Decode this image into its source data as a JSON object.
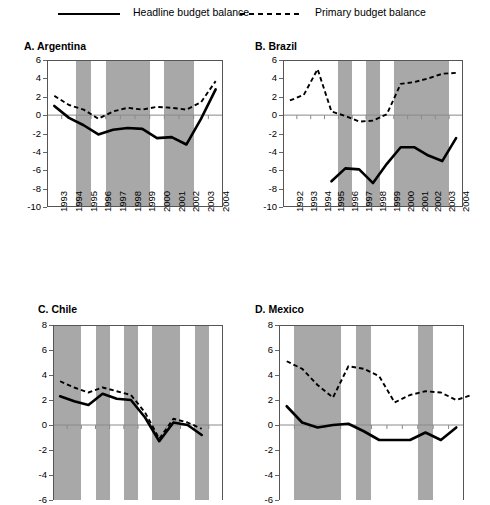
{
  "legend": {
    "items": [
      {
        "label": "Headline budget balance",
        "style": "solid"
      },
      {
        "label": "Primary budget balance",
        "style": "dashed"
      }
    ]
  },
  "chart_data": [
    {
      "type": "line",
      "title": "A. Argentina",
      "xlabel": "",
      "ylabel": "",
      "ylim": [
        -10,
        6
      ],
      "yticks": [
        6,
        4,
        2,
        0,
        -2,
        -4,
        -6,
        -8,
        -10
      ],
      "grid": false,
      "legend_position": "top",
      "categories": [
        "1993",
        "1994",
        "1995",
        "1996",
        "1997",
        "1998",
        "1999",
        "2000",
        "2001",
        "2002",
        "2003",
        "2004"
      ],
      "shaded_bands": [
        [
          "1995",
          "1995"
        ],
        [
          "1997",
          "1999"
        ],
        [
          "2001",
          "2002"
        ]
      ],
      "series": [
        {
          "name": "Headline budget balance",
          "style": "solid",
          "values": [
            1.0,
            -0.3,
            -1.1,
            -2.1,
            -1.6,
            -1.4,
            -1.5,
            -2.5,
            -2.4,
            -3.2,
            -0.4,
            2.8
          ]
        },
        {
          "name": "Primary budget balance",
          "style": "dashed",
          "values": [
            2.1,
            1.1,
            0.6,
            -0.4,
            0.4,
            0.8,
            0.6,
            0.9,
            0.8,
            0.6,
            1.4,
            3.7
          ]
        }
      ]
    },
    {
      "type": "line",
      "title": "B. Brazil",
      "xlabel": "",
      "ylabel": "",
      "ylim": [
        -10,
        6
      ],
      "yticks": [
        6,
        4,
        2,
        0,
        -2,
        -4,
        -6,
        -8,
        -10
      ],
      "grid": false,
      "legend_position": "top",
      "categories": [
        "1992",
        "1993",
        "1994",
        "1995",
        "1996",
        "1997",
        "1998",
        "1999",
        "2000",
        "2001",
        "2002",
        "2003",
        "2004"
      ],
      "shaded_bands": [
        [
          "1996",
          "1996"
        ],
        [
          "1998",
          "1998"
        ],
        [
          "2000",
          "2003"
        ]
      ],
      "series": [
        {
          "name": "Headline budget balance",
          "style": "solid",
          "values": [
            null,
            null,
            null,
            -7.2,
            -5.8,
            -5.9,
            -7.4,
            -5.3,
            -3.5,
            -3.5,
            -4.4,
            -5.0,
            -2.5
          ]
        },
        {
          "name": "Primary budget balance",
          "style": "dashed",
          "values": [
            1.6,
            2.2,
            5.0,
            0.4,
            -0.1,
            -0.7,
            -0.6,
            0.1,
            3.4,
            3.6,
            4.0,
            4.5,
            4.6
          ]
        }
      ]
    },
    {
      "type": "line",
      "title": "C. Chile",
      "xlabel": "",
      "ylabel": "",
      "ylim": [
        -6,
        8
      ],
      "yticks": [
        8,
        6,
        4,
        2,
        0,
        -2,
        -4,
        -6
      ],
      "grid": false,
      "legend_position": "top",
      "categories": [
        "1",
        "2",
        "3",
        "4",
        "5",
        "6",
        "7",
        "8",
        "9",
        "10",
        "11",
        "12"
      ],
      "shaded_bands": [
        [
          "1",
          "2"
        ],
        [
          "4",
          "4"
        ],
        [
          "6",
          "6"
        ],
        [
          "8",
          "9"
        ],
        [
          "11",
          "11"
        ]
      ],
      "series": [
        {
          "name": "Headline budget balance",
          "style": "solid",
          "values": [
            2.3,
            1.9,
            1.6,
            2.5,
            2.1,
            2.0,
            0.6,
            -1.3,
            0.2,
            0.0,
            -0.8,
            null
          ]
        },
        {
          "name": "Primary budget balance",
          "style": "dashed",
          "values": [
            3.5,
            3.0,
            2.6,
            3.0,
            2.7,
            2.4,
            1.0,
            -1.1,
            0.5,
            0.2,
            -0.3,
            null
          ]
        }
      ]
    },
    {
      "type": "line",
      "title": "D. Mexico",
      "xlabel": "",
      "ylabel": "",
      "ylim": [
        -6,
        8
      ],
      "yticks": [
        8,
        6,
        4,
        2,
        0,
        -2,
        -4,
        -6
      ],
      "grid": false,
      "legend_position": "top",
      "categories": [
        "1",
        "2",
        "3",
        "4",
        "5",
        "6",
        "7",
        "8",
        "9",
        "10",
        "11",
        "12"
      ],
      "shaded_bands": [
        [
          "2",
          "4"
        ],
        [
          "6",
          "6"
        ],
        [
          "10",
          "10"
        ]
      ],
      "series": [
        {
          "name": "Headline budget balance",
          "style": "solid",
          "values": [
            1.5,
            0.2,
            -0.2,
            0.0,
            0.1,
            -0.5,
            -1.2,
            -1.2,
            -1.2,
            -0.6,
            -1.2,
            -0.2
          ]
        },
        {
          "name": "Primary budget balance",
          "style": "dashed",
          "values": [
            5.1,
            4.5,
            3.2,
            2.2,
            4.7,
            4.5,
            3.9,
            1.8,
            2.4,
            2.7,
            2.6,
            2.0,
            2.4
          ]
        }
      ]
    }
  ],
  "colors": {
    "shading": "#a8a8a8",
    "line": "#000000",
    "axis": "#555555",
    "zero_line": "#8a8a8a"
  }
}
